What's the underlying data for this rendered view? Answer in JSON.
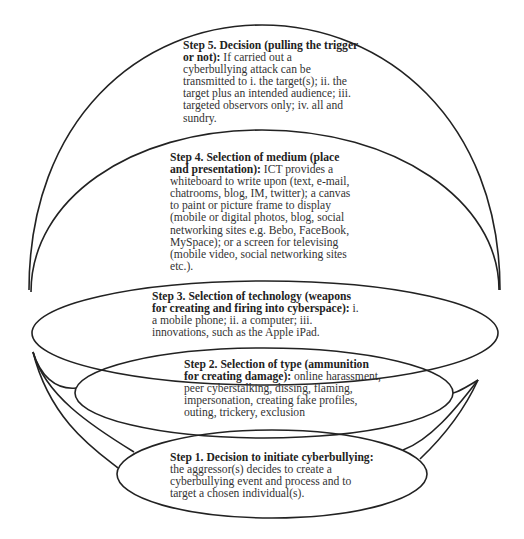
{
  "diagram": {
    "type": "nested-ellipse-process",
    "steps": [
      {
        "id": "step5",
        "title": "Step 5. Decision (pulling the trigger or not):",
        "text": "If carried out a cyberbullying attack can be transmitted to i. the target(s); ii. the target plus an intended audience; iii. targeted observors only; iv. all and sundry."
      },
      {
        "id": "step4",
        "title": "Step 4. Selection of medium (place and presentation):",
        "text": "ICT provides a whiteboard to write upon (text, e-mail, chatrooms, blog, IM, twitter); a canvas to paint or picture frame to display (mobile or digital photos, blog, social networking sites e.g. Bebo, FaceBook, MySpace); or a screen for televising (mobile video, social networking sites etc.)."
      },
      {
        "id": "step3",
        "title": "Step 3. Selection of technology (weapons for creating and firing into cyberspace):",
        "text": "i. a mobile phone; ii. a computer; iii. innovations, such as the Apple iPad."
      },
      {
        "id": "step2",
        "title": "Step 2. Selection of type (ammunition for creating damage):",
        "text": "online harassment, peer cyberstalking, dissing, flaming, impersonation, creating fake profiles, outing, trickery, exclusion"
      },
      {
        "id": "step1",
        "title": "Step 1. Decision to initiate cyberbullying:",
        "text": "the aggressor(s) decides to create a cyberbullying event and process and to target a chosen individual(s)."
      }
    ],
    "line_color": "#222222",
    "background": "#ffffff"
  }
}
